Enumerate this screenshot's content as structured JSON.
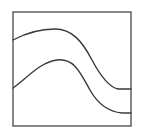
{
  "figure": {
    "title": "Two nested S-curves in a rectangular frame",
    "canvas": {
      "width": 142,
      "height": 140,
      "background_color": "#ffffff"
    },
    "frame": {
      "name": "rectangular-border",
      "x": 13,
      "y": 12,
      "width": 118,
      "height": 114,
      "stroke_color": "#555555",
      "stroke_width": 1.4,
      "fill": "none"
    },
    "curves": [
      {
        "name": "upper-curve",
        "label": "Upper S-curve",
        "stroke_color": "#3a3a3a",
        "stroke_width": 1.4,
        "fill": "none",
        "start": {
          "x": 13,
          "y": 40
        },
        "crest": {
          "x": 55,
          "y": 29
        },
        "end": {
          "x": 131,
          "y": 89
        },
        "path": "M 13 40 C 26 33, 40 29, 55 29 C 72 29, 82 41, 92 60 C 101 77, 109 87, 118 89 L 131 89"
      },
      {
        "name": "lower-curve",
        "label": "Lower S-curve",
        "stroke_color": "#3a3a3a",
        "stroke_width": 1.4,
        "fill": "none",
        "start": {
          "x": 13,
          "y": 88
        },
        "crest": {
          "x": 57,
          "y": 60
        },
        "end": {
          "x": 131,
          "y": 113
        },
        "path": "M 13 88 C 26 79, 40 62, 57 60 C 74 58, 80 72, 90 90 C 99 106, 111 112, 122 113 L 131 113"
      }
    ]
  }
}
